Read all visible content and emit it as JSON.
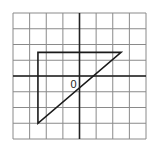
{
  "diagram": {
    "type": "coordinate-grid",
    "grid": {
      "columns": 8,
      "rows": 8,
      "x_range": [
        -4,
        4
      ],
      "y_range": [
        -4,
        4
      ],
      "line_color": "#8a8a8a",
      "axis_color": "#222222"
    },
    "origin_label": "0",
    "triangle": {
      "vertices": [
        [
          -2.5,
          1.5
        ],
        [
          2.5,
          1.5
        ],
        [
          -2.5,
          -3
        ]
      ],
      "stroke": "#1a1a1a"
    }
  }
}
